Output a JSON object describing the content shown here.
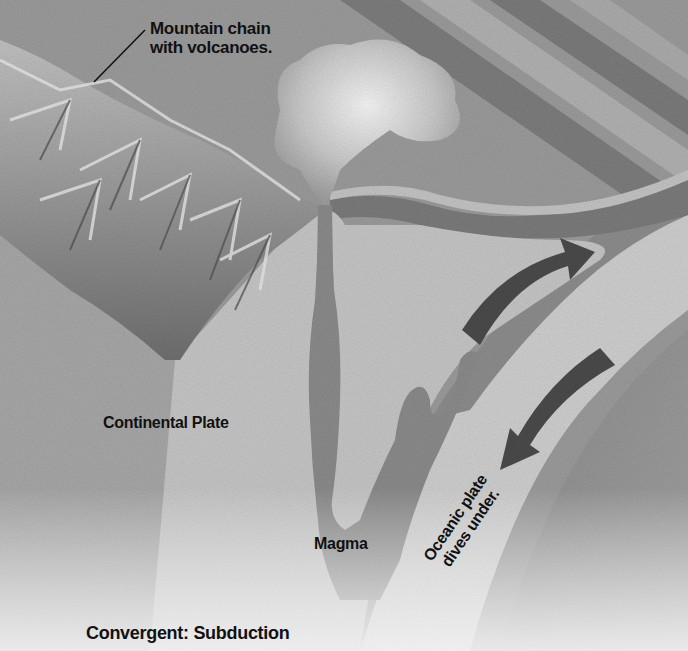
{
  "diagram": {
    "title": "Convergent: Subduction",
    "labels": {
      "mountain_chain": [
        "Mountain chain",
        "with volcanoes."
      ],
      "continental_plate": "Continental Plate",
      "magma": "Magma",
      "oceanic_plate": [
        "Oceanic plate",
        "dives under."
      ]
    },
    "elements": [
      {
        "name": "mountain-chain",
        "description": "Jagged mountain ridges on the continental plate"
      },
      {
        "name": "volcano",
        "description": "Volcano conduit with ash cloud"
      },
      {
        "name": "magma-chamber",
        "description": "Vertical magma column rising from subducting plate"
      },
      {
        "name": "oceanic-plate",
        "description": "Curved slab descending beneath continental plate"
      },
      {
        "name": "arrow-up",
        "description": "Curved arrow pointing up-right"
      },
      {
        "name": "arrow-down",
        "description": "Curved arrow pointing down-left"
      }
    ],
    "colors": {
      "background": "#9c9c9c",
      "continental_light": "#c4c4c4",
      "oceanic_light": "#cfcfcf",
      "mantle": "#8e8e8e",
      "magma": "#8a8a8a",
      "arrow": "#4a4a4a",
      "text": "#111111"
    }
  }
}
